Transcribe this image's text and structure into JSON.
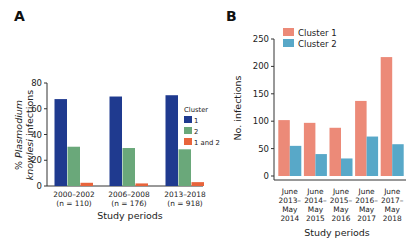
{
  "chart_data": [
    {
      "panel": "A",
      "type": "bar",
      "title": "",
      "xlabel": "Study periods",
      "ylabel": "% Plasmodium knowlesi infections",
      "ylabel_parts": [
        {
          "text": "% ",
          "italic": false
        },
        {
          "text": "Plasmodium",
          "italic": true
        }
      ],
      "ylabel_line2_parts": [
        {
          "text": "knowlesi",
          "italic": true
        },
        {
          "text": " infections",
          "italic": false
        }
      ],
      "categories": [
        "2000–2002",
        "2006–2008",
        "2013–2018"
      ],
      "category_sublabels": [
        "(n = 110)",
        "(n = 176)",
        "(n = 918)"
      ],
      "ylim": [
        0,
        80
      ],
      "yticks": [
        0,
        20,
        40,
        60,
        80
      ],
      "grid": false,
      "legend": {
        "title": "Cluster",
        "placement": "right"
      },
      "series": [
        {
          "name": "1",
          "color": "#1f3a8f",
          "values": [
            67.5,
            69.5,
            70.5
          ]
        },
        {
          "name": "2",
          "color": "#6aa87a",
          "values": [
            30.5,
            29.5,
            28.5
          ]
        },
        {
          "name": "1 and 2",
          "color": "#e8643c",
          "values": [
            2.5,
            2.0,
            3.0
          ]
        }
      ]
    },
    {
      "panel": "B",
      "type": "bar",
      "title": "",
      "xlabel": "Study periods",
      "ylabel": "No. infections",
      "categories": [
        [
          "June",
          "2013–",
          "May",
          "2014"
        ],
        [
          "June",
          "2014–",
          "May",
          "2015"
        ],
        [
          "June",
          "2015–",
          "May",
          "2016"
        ],
        [
          "June",
          "2016–",
          "May",
          "2017"
        ],
        [
          "June",
          "2017–",
          "May",
          "2018"
        ]
      ],
      "ylim": [
        0,
        250
      ],
      "yticks": [
        0,
        50,
        100,
        150,
        200,
        250
      ],
      "grid": false,
      "legend": {
        "title": "",
        "placement": "top-left"
      },
      "series": [
        {
          "name": "Cluster 1",
          "color": "#ec8a78",
          "values": [
            102,
            97,
            88,
            137,
            217
          ]
        },
        {
          "name": "Cluster 2",
          "color": "#58a8c8",
          "values": [
            55,
            40,
            32,
            72,
            58
          ]
        }
      ]
    }
  ],
  "panels": {
    "a_label": "A",
    "b_label": "B"
  }
}
